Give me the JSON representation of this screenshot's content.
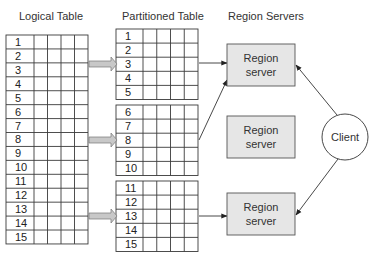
{
  "headers": {
    "logical": "Logical Table",
    "partitioned": "Partitioned Table",
    "servers": "Region Servers"
  },
  "logical_table": {
    "rows": [
      "1",
      "2",
      "3",
      "4",
      "5",
      "6",
      "7",
      "8",
      "9",
      "10",
      "11",
      "12",
      "13",
      "14",
      "15"
    ],
    "extra_columns": 4
  },
  "partitions": [
    {
      "rows": [
        "1",
        "2",
        "3",
        "4",
        "5"
      ]
    },
    {
      "rows": [
        "6",
        "7",
        "8",
        "9",
        "10"
      ]
    },
    {
      "rows": [
        "11",
        "12",
        "13",
        "14",
        "15"
      ]
    }
  ],
  "region_servers": [
    {
      "line1": "Region",
      "line2": "server"
    },
    {
      "line1": "Region",
      "line2": "server"
    },
    {
      "line1": "Region",
      "line2": "server"
    }
  ],
  "client": {
    "label": "Client"
  },
  "colors": {
    "server_fill": "#e6e6e6",
    "server_stroke": "#555555",
    "arrow_fill": "#c8c8c8",
    "line": "#333333"
  }
}
